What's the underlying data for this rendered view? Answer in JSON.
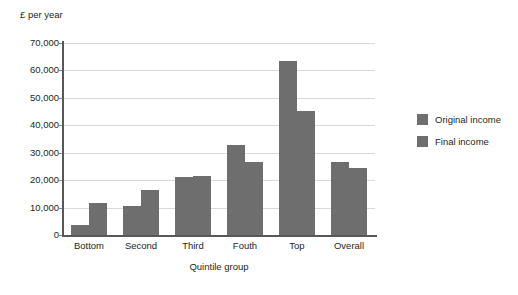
{
  "chart_data": {
    "type": "bar",
    "title": "",
    "subtitle": "",
    "ylabel": "£ per year",
    "xlabel": "Quintile group",
    "categories": [
      "Bottom",
      "Second",
      "Third",
      "Fouth",
      "Top",
      "Overall"
    ],
    "series": [
      {
        "name": "Original income",
        "color": "#6e6e6e",
        "values": [
          3500,
          10500,
          21000,
          33000,
          63500,
          26500
        ]
      },
      {
        "name": "Final income",
        "color": "#6e6e6e",
        "values": [
          11500,
          16300,
          21400,
          26700,
          45200,
          24300
        ]
      }
    ],
    "ylim": [
      0,
      70000
    ],
    "ytick_values": [
      0,
      10000,
      20000,
      30000,
      40000,
      50000,
      60000,
      70000
    ],
    "ytick_labels": [
      "0",
      "10,000",
      "20,000",
      "30,000",
      "40,000",
      "50,000",
      "60,000",
      "70,000"
    ],
    "grid": "horizontal",
    "legend_position": "right",
    "legend_entries": [
      "Original income",
      "Final income"
    ],
    "axis_color": "#58585a",
    "gridline_color": "#d9d9d9",
    "background": "#ffffff"
  },
  "artifact": {
    "bottom_row": ""
  }
}
